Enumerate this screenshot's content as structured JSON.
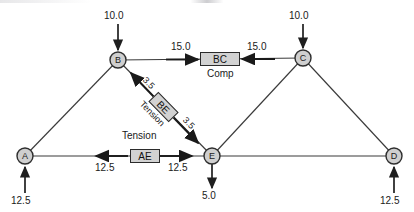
{
  "diagram": {
    "type": "truss-analysis",
    "background_color": "#ffffff",
    "line_color": "#3a3a3a",
    "box_fill_color": "#d2d2d2",
    "box_border_color": "#2b2b2b",
    "node_fill_color": "#cfcfcf"
  },
  "nodes": [
    {
      "id": "A",
      "label": "A",
      "x": 25,
      "y": 156
    },
    {
      "id": "B",
      "label": "B",
      "x": 118,
      "y": 60
    },
    {
      "id": "C",
      "label": "C",
      "x": 303,
      "y": 58
    },
    {
      "id": "E",
      "label": "E",
      "x": 212,
      "y": 156
    },
    {
      "id": "D",
      "label": "D",
      "x": 394,
      "y": 156
    }
  ],
  "members": [
    {
      "id": "AB",
      "from": "A",
      "to": "B"
    },
    {
      "id": "BC",
      "from": "B",
      "to": "C"
    },
    {
      "id": "BE",
      "from": "B",
      "to": "E"
    },
    {
      "id": "AE",
      "from": "A",
      "to": "E"
    },
    {
      "id": "CE",
      "from": "C",
      "to": "E"
    },
    {
      "id": "CD",
      "from": "C",
      "to": "D"
    },
    {
      "id": "ED",
      "from": "E",
      "to": "D"
    }
  ],
  "loads": [
    {
      "id": "load-B",
      "node": "B",
      "value": "10.0",
      "direction": "down"
    },
    {
      "id": "load-C",
      "node": "C",
      "value": "10.0",
      "direction": "down"
    },
    {
      "id": "load-E",
      "node": "E",
      "value": "5.0",
      "direction": "down"
    }
  ],
  "reactions": [
    {
      "id": "reaction-A",
      "node": "A",
      "value": "12.5",
      "direction": "up"
    },
    {
      "id": "reaction-D",
      "node": "D",
      "value": "12.5",
      "direction": "up"
    }
  ],
  "member_force_labels": [
    {
      "id": "BC",
      "name": "BC",
      "state": "Comp",
      "magnitude": "15.0",
      "left_value": "15.0",
      "right_value": "15.0",
      "arrow_sense": "inward"
    },
    {
      "id": "AE",
      "name": "AE",
      "state": "Tension",
      "magnitude": "12.5",
      "left_value": "12.5",
      "right_value": "12.5",
      "arrow_sense": "outward"
    },
    {
      "id": "BE",
      "name": "BE",
      "state": "Tension",
      "magnitude": "3.5",
      "left_value": "3.5",
      "right_value": "3.5",
      "arrow_sense": "outward"
    }
  ]
}
